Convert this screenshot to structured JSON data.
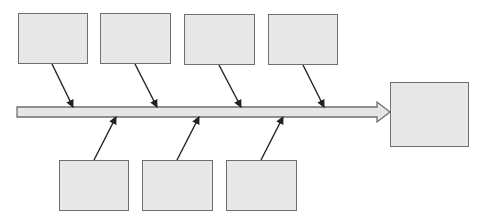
{
  "diagram": {
    "type": "fishbone",
    "colors": {
      "box_fill": "#e8e8e8",
      "box_border": "#6f6f6f",
      "arrow": "#222222",
      "spine_fill": "#e6e6e6"
    },
    "top_causes": [
      {
        "label": "",
        "x": 18,
        "y": 13,
        "w": 70,
        "h": 51
      },
      {
        "label": "",
        "x": 100,
        "y": 13,
        "w": 71,
        "h": 51
      },
      {
        "label": "",
        "x": 184,
        "y": 14,
        "w": 71,
        "h": 51
      },
      {
        "label": "",
        "x": 268,
        "y": 14,
        "w": 70,
        "h": 51
      }
    ],
    "bottom_causes": [
      {
        "label": "",
        "x": 59,
        "y": 160,
        "w": 70,
        "h": 51
      },
      {
        "label": "",
        "x": 142,
        "y": 160,
        "w": 71,
        "h": 51
      },
      {
        "label": "",
        "x": 226,
        "y": 160,
        "w": 71,
        "h": 51
      }
    ],
    "effect": {
      "label": "",
      "x": 390,
      "y": 82,
      "w": 79,
      "h": 65
    }
  }
}
